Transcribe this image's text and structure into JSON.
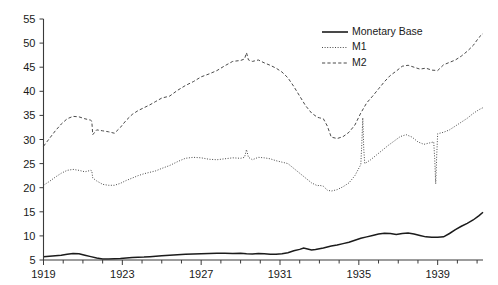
{
  "chart_data": {
    "type": "line",
    "title": "",
    "subtitle": "",
    "xlabel": "",
    "ylabel": "",
    "xlim": [
      1919.0,
      1941.3
    ],
    "ylim": [
      5,
      55
    ],
    "grid": false,
    "legend_position": "top-right",
    "y_ticks": [
      5,
      10,
      15,
      20,
      25,
      30,
      35,
      40,
      45,
      50,
      55
    ],
    "y_tick_labels": [
      "5",
      "10",
      "15",
      "20",
      "25",
      "30",
      "35",
      "40",
      "45",
      "50",
      "55"
    ],
    "x_ticks": [
      1919,
      1923,
      1927,
      1931,
      1935,
      1939
    ],
    "x_tick_labels": [
      "1919",
      "1923",
      "1927",
      "1931",
      "1935",
      "1939"
    ],
    "x_minor_tick_interval": 1,
    "legend": [
      "Monetary Base",
      "M1",
      "M2"
    ],
    "series": [
      {
        "name": "Monetary Base",
        "style": "solid",
        "color": "#1b1b1b",
        "x": [
          1919.0,
          1919.3,
          1919.6,
          1919.9,
          1920.2,
          1920.5,
          1920.8,
          1921.1,
          1921.4,
          1921.7,
          1922.0,
          1922.3,
          1922.6,
          1922.9,
          1923.2,
          1923.5,
          1923.8,
          1924.1,
          1924.4,
          1924.7,
          1925.0,
          1925.4,
          1925.8,
          1926.2,
          1926.6,
          1927.0,
          1927.4,
          1927.8,
          1928.2,
          1928.6,
          1929.0,
          1929.3,
          1929.6,
          1929.9,
          1930.2,
          1930.5,
          1930.8,
          1931.1,
          1931.4,
          1931.7,
          1932.0,
          1932.2,
          1932.4,
          1932.6,
          1932.8,
          1933.0,
          1933.2,
          1933.4,
          1933.6,
          1933.9,
          1934.2,
          1934.5,
          1934.8,
          1935.1,
          1935.4,
          1935.7,
          1936.0,
          1936.3,
          1936.6,
          1936.9,
          1937.2,
          1937.5,
          1937.8,
          1938.1,
          1938.4,
          1938.7,
          1939.0,
          1939.3,
          1939.6,
          1939.9,
          1940.2,
          1940.5,
          1940.8,
          1941.1,
          1941.3
        ],
        "y": [
          5.7,
          5.8,
          5.9,
          6.0,
          6.2,
          6.35,
          6.3,
          6.0,
          5.7,
          5.4,
          5.2,
          5.2,
          5.25,
          5.3,
          5.4,
          5.5,
          5.55,
          5.6,
          5.7,
          5.8,
          5.9,
          6.0,
          6.1,
          6.2,
          6.25,
          6.3,
          6.35,
          6.4,
          6.4,
          6.35,
          6.4,
          6.3,
          6.25,
          6.35,
          6.3,
          6.2,
          6.2,
          6.3,
          6.5,
          6.9,
          7.2,
          7.5,
          7.3,
          7.1,
          7.2,
          7.35,
          7.5,
          7.7,
          7.9,
          8.1,
          8.4,
          8.7,
          9.1,
          9.5,
          9.8,
          10.1,
          10.4,
          10.55,
          10.5,
          10.3,
          10.5,
          10.6,
          10.4,
          10.1,
          9.8,
          9.7,
          9.7,
          9.8,
          10.5,
          11.3,
          12.0,
          12.6,
          13.3,
          14.2,
          14.9
        ]
      },
      {
        "name": "M1",
        "style": "dotted",
        "color": "#4a4a4a",
        "x": [
          1919.0,
          1919.3,
          1919.6,
          1919.9,
          1920.2,
          1920.5,
          1920.8,
          1921.1,
          1921.4,
          1921.45,
          1921.5,
          1921.7,
          1922.0,
          1922.3,
          1922.6,
          1922.9,
          1923.2,
          1923.5,
          1923.8,
          1924.1,
          1924.4,
          1924.7,
          1925.0,
          1925.4,
          1925.8,
          1926.2,
          1926.6,
          1927.0,
          1927.4,
          1927.8,
          1928.2,
          1928.6,
          1929.0,
          1929.2,
          1929.3,
          1929.4,
          1929.6,
          1929.9,
          1930.2,
          1930.5,
          1930.8,
          1931.1,
          1931.4,
          1931.7,
          1932.0,
          1932.3,
          1932.6,
          1932.9,
          1933.0,
          1933.2,
          1933.4,
          1933.6,
          1933.9,
          1934.2,
          1934.5,
          1934.8,
          1935.1,
          1935.15,
          1935.2,
          1935.25,
          1935.3,
          1935.6,
          1935.9,
          1936.2,
          1936.5,
          1936.8,
          1937.1,
          1937.4,
          1937.7,
          1938.0,
          1938.3,
          1938.6,
          1938.8,
          1938.85,
          1938.9,
          1938.95,
          1939.0,
          1939.3,
          1939.6,
          1939.9,
          1940.2,
          1940.5,
          1940.8,
          1941.1,
          1941.3
        ],
        "y": [
          20.5,
          21.3,
          22.2,
          23.0,
          23.6,
          23.8,
          23.6,
          23.3,
          23.6,
          23.5,
          22.0,
          21.4,
          20.7,
          20.5,
          20.5,
          20.9,
          21.5,
          22.0,
          22.5,
          22.9,
          23.2,
          23.5,
          24.0,
          24.6,
          25.4,
          26.1,
          26.3,
          26.2,
          25.9,
          25.8,
          26.0,
          26.2,
          26.1,
          26.3,
          27.9,
          26.3,
          25.8,
          26.3,
          26.2,
          26.0,
          25.6,
          25.3,
          25.0,
          24.0,
          23.0,
          22.0,
          21.0,
          20.4,
          20.5,
          20.3,
          19.5,
          19.3,
          19.6,
          20.2,
          21.0,
          22.5,
          24.8,
          29.0,
          34.5,
          28.0,
          25.0,
          25.8,
          26.8,
          27.8,
          28.8,
          29.7,
          30.6,
          31.0,
          30.5,
          29.5,
          29.0,
          29.3,
          29.5,
          26.0,
          20.8,
          26.5,
          31.2,
          31.5,
          32.0,
          32.8,
          33.6,
          34.4,
          35.4,
          36.2,
          36.6
        ]
      },
      {
        "name": "M2",
        "style": "dashed",
        "color": "#4a4a4a",
        "x": [
          1919.0,
          1919.3,
          1919.6,
          1919.9,
          1920.2,
          1920.5,
          1920.8,
          1921.1,
          1921.4,
          1921.45,
          1921.5,
          1921.7,
          1922.0,
          1922.3,
          1922.6,
          1922.9,
          1923.2,
          1923.5,
          1923.8,
          1924.1,
          1924.4,
          1924.7,
          1925.0,
          1925.4,
          1925.8,
          1926.2,
          1926.6,
          1927.0,
          1927.4,
          1927.8,
          1928.2,
          1928.6,
          1929.0,
          1929.2,
          1929.3,
          1929.4,
          1929.6,
          1929.9,
          1930.2,
          1930.5,
          1930.8,
          1931.1,
          1931.4,
          1931.7,
          1932.0,
          1932.3,
          1932.6,
          1932.9,
          1933.0,
          1933.2,
          1933.4,
          1933.6,
          1933.9,
          1934.2,
          1934.5,
          1934.8,
          1935.1,
          1935.4,
          1935.7,
          1936.0,
          1936.3,
          1936.6,
          1936.9,
          1937.2,
          1937.5,
          1937.8,
          1938.1,
          1938.4,
          1938.7,
          1939.0,
          1939.3,
          1939.6,
          1939.9,
          1940.2,
          1940.5,
          1940.8,
          1941.1,
          1941.3
        ],
        "y": [
          28.6,
          30.2,
          31.8,
          33.2,
          34.3,
          34.8,
          34.7,
          34.3,
          34.0,
          33.8,
          31.0,
          32.0,
          31.8,
          31.6,
          31.3,
          32.5,
          34.0,
          35.2,
          36.0,
          36.6,
          37.2,
          37.9,
          38.6,
          39.0,
          40.2,
          41.2,
          42.0,
          43.0,
          43.6,
          44.3,
          45.3,
          46.2,
          46.4,
          46.7,
          48.0,
          46.5,
          46.2,
          46.5,
          45.9,
          45.4,
          44.8,
          44.0,
          42.8,
          41.0,
          39.0,
          37.0,
          35.5,
          34.6,
          34.5,
          34.3,
          32.8,
          30.5,
          30.2,
          30.6,
          31.5,
          33.0,
          35.5,
          37.6,
          39.0,
          40.5,
          42.0,
          43.3,
          44.2,
          45.2,
          45.4,
          45.0,
          44.6,
          44.8,
          44.4,
          44.3,
          45.5,
          46.0,
          46.5,
          47.3,
          48.3,
          49.5,
          51.2,
          52.0
        ]
      }
    ]
  },
  "legend": {
    "entries": [
      {
        "label": "Monetary Base",
        "style": "solid"
      },
      {
        "label": "M1",
        "style": "dotted"
      },
      {
        "label": "M2",
        "style": "dashed"
      }
    ]
  }
}
